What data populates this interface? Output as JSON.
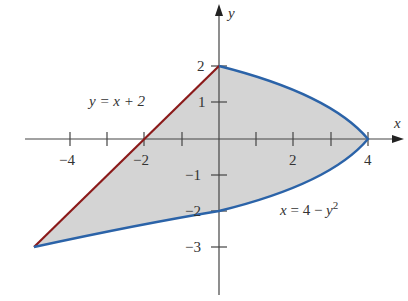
{
  "figure": {
    "axes": {
      "x_label": "x",
      "y_label": "y",
      "x_ticks": [
        {
          "value": -4,
          "label": "−4"
        },
        {
          "value": -2,
          "label": "−2"
        },
        {
          "value": 2,
          "label": "2"
        },
        {
          "value": 4,
          "label": "4"
        }
      ],
      "y_ticks": [
        {
          "value": 2,
          "label": "2"
        },
        {
          "value": 1,
          "label": "1"
        },
        {
          "value": -1,
          "label": "−1"
        },
        {
          "value": -2,
          "label": "−2"
        },
        {
          "value": -3,
          "label": "−3"
        }
      ]
    },
    "curves": {
      "line": {
        "equation": "y = x + 2",
        "color": "#8b1a1a"
      },
      "parabola": {
        "equation_prefix": "x = 4 − ",
        "equation_var": "y",
        "equation_exp": "2",
        "color": "#2b63a8"
      }
    },
    "region": {
      "fill": "#d3d3d3",
      "description": "Region bounded by y = x + 2 and x = 4 − y²"
    }
  }
}
